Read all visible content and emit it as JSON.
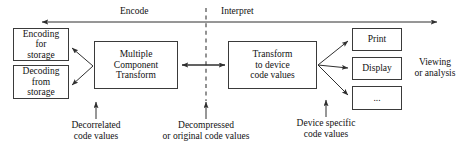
{
  "diagram": {
    "colors": {
      "stroke": "#3a3a3a",
      "text": "#111111",
      "background": "#ffffff",
      "dashed_divider": "#3a3a3a"
    },
    "phases": {
      "encode": "Encode",
      "interpret": "Interpret"
    },
    "boxes": {
      "encoding_storage": "Encoding\nfor\nstorage",
      "decoding_storage": "Decoding\nfrom\nstorage",
      "multiple_component_transform": "Multiple\nComponent\nTransform",
      "transform_to_device": "Transform\nto device\ncode values",
      "print": "Print",
      "display": "Display",
      "ellipsis": "..."
    },
    "annotations": {
      "decorrelated": "Decorrelated\ncode values",
      "decompressed": "Decompressed\nor original code values",
      "device_specific": "Device specific\ncode values",
      "viewing": "Viewing\nor analysis"
    }
  }
}
